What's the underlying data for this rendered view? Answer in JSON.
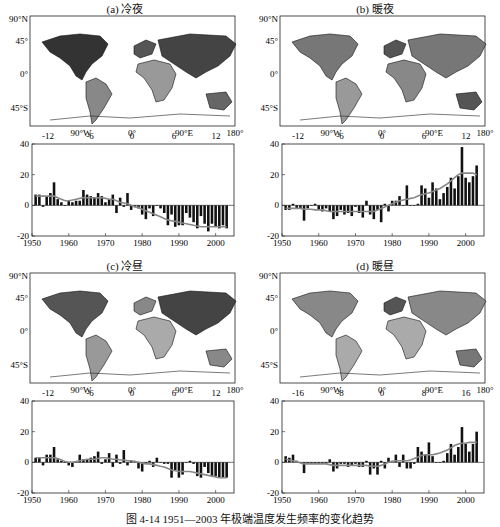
{
  "caption": "图 4-14   1951—2003 年极端温度发生频率的变化趋势",
  "map_axis": {
    "lat_labels": [
      "90°N",
      "45°",
      "0°",
      "45°S"
    ],
    "lon_labels": [
      "90°W",
      "0°",
      "90°E",
      "180°"
    ]
  },
  "panels": [
    {
      "id": "a",
      "title": "(a) 冷夜",
      "colorbar_ticks": [
        "-12",
        "-6",
        "0",
        "6",
        "12"
      ]
    },
    {
      "id": "b",
      "title": "(b) 暖夜",
      "colorbar_ticks": [
        "-12",
        "-6",
        "0",
        "6",
        "12"
      ]
    },
    {
      "id": "c",
      "title": "(c) 冷昼",
      "colorbar_ticks": [
        "-12",
        "-6",
        "0",
        "6",
        "12"
      ]
    },
    {
      "id": "d",
      "title": "(d) 暖昼",
      "colorbar_ticks": [
        "-16",
        "-8",
        "0",
        "8",
        "16"
      ]
    }
  ],
  "chart_data": [
    {
      "type": "bar",
      "title": "(a) 冷夜",
      "xlabel": "",
      "ylabel": "",
      "x": [
        1951,
        1952,
        1953,
        1954,
        1955,
        1956,
        1957,
        1958,
        1959,
        1960,
        1961,
        1962,
        1963,
        1964,
        1965,
        1966,
        1967,
        1968,
        1969,
        1970,
        1971,
        1972,
        1973,
        1974,
        1975,
        1976,
        1977,
        1978,
        1979,
        1980,
        1981,
        1982,
        1983,
        1984,
        1985,
        1986,
        1987,
        1988,
        1989,
        1990,
        1991,
        1992,
        1993,
        1994,
        1995,
        1996,
        1997,
        1998,
        1999,
        2000,
        2001,
        2002,
        2003
      ],
      "values": [
        7,
        7,
        -1,
        6,
        8,
        15,
        4,
        2,
        0,
        3,
        2,
        3,
        3,
        10,
        7,
        6,
        5,
        8,
        6,
        2,
        4,
        7,
        -5,
        5,
        -1,
        8,
        -3,
        -1,
        -2,
        -6,
        -9,
        -2,
        -7,
        0,
        -2,
        -5,
        -13,
        -6,
        -14,
        -13,
        -13,
        -5,
        -8,
        -11,
        -15,
        -7,
        -12,
        -17,
        -12,
        -14,
        -15,
        -13,
        -15
      ],
      "trend": [
        6,
        6,
        6,
        6,
        6,
        6,
        5,
        4,
        3,
        3,
        3.5,
        4,
        4.5,
        5,
        5,
        5,
        5,
        5,
        5,
        4.5,
        4,
        4,
        3,
        2,
        1.5,
        1,
        0,
        -1,
        -1.5,
        -2.5,
        -3.5,
        -4.5,
        -5.5,
        -6.5,
        -7.5,
        -8.5,
        -9.5,
        -10,
        -10.5,
        -11,
        -11.5,
        -12,
        -12.5,
        -13,
        -13.5,
        -14,
        -14,
        -14,
        -14,
        -14,
        -14,
        -14,
        -14
      ],
      "xlim": [
        1950,
        2005
      ],
      "ylim": [
        -20,
        40
      ],
      "xticks": [
        "1950",
        "1960",
        "1970",
        "1980",
        "1990",
        "2000"
      ],
      "yticks": [
        "-20",
        "0",
        "20",
        "40"
      ]
    },
    {
      "type": "bar",
      "title": "(b) 暖夜",
      "xlabel": "",
      "ylabel": "",
      "x": [
        1951,
        1952,
        1953,
        1954,
        1955,
        1956,
        1957,
        1958,
        1959,
        1960,
        1961,
        1962,
        1963,
        1964,
        1965,
        1966,
        1967,
        1968,
        1969,
        1970,
        1971,
        1972,
        1973,
        1974,
        1975,
        1976,
        1977,
        1978,
        1979,
        1980,
        1981,
        1982,
        1983,
        1984,
        1985,
        1986,
        1987,
        1988,
        1989,
        1990,
        1991,
        1992,
        1993,
        1994,
        1995,
        1996,
        1997,
        1998,
        1999,
        2000,
        2001,
        2002,
        2003
      ],
      "values": [
        -3,
        -3,
        1,
        -2,
        -2,
        -10,
        -2,
        0,
        1,
        -3,
        -4,
        -2,
        -4,
        -9,
        -7,
        -3,
        -6,
        -5,
        -7,
        -1,
        -5,
        -8,
        3,
        -6,
        -9,
        -3,
        -11,
        1,
        -4,
        3,
        3,
        6,
        0,
        13,
        0,
        0,
        1,
        13,
        11,
        5,
        15,
        11,
        4,
        8,
        12,
        18,
        11,
        19,
        38,
        18,
        15,
        19,
        26,
        21
      ],
      "trend": [
        -2,
        -2,
        -2,
        -2,
        -2,
        -2.5,
        -2.5,
        -2.5,
        -3,
        -3,
        -3,
        -3.5,
        -4,
        -4,
        -4,
        -4,
        -4,
        -4,
        -4,
        -4,
        -4,
        -4,
        -4,
        -4,
        -4,
        -3,
        -2,
        -1,
        0,
        1,
        2,
        3,
        3.5,
        4,
        4.5,
        5,
        6,
        7,
        7.5,
        8,
        9,
        10,
        11,
        12.5,
        14,
        16,
        18,
        20,
        21,
        21,
        21,
        21,
        20
      ],
      "xlim": [
        1950,
        2005
      ],
      "ylim": [
        -20,
        40
      ],
      "xticks": [
        "1950",
        "1960",
        "1970",
        "1980",
        "1990",
        "2000"
      ],
      "yticks": [
        "-20",
        "0",
        "20",
        "40"
      ]
    },
    {
      "type": "bar",
      "title": "(c) 冷昼",
      "xlabel": "",
      "ylabel": "",
      "x": [
        1951,
        1952,
        1953,
        1954,
        1955,
        1956,
        1957,
        1958,
        1959,
        1960,
        1961,
        1962,
        1963,
        1964,
        1965,
        1966,
        1967,
        1968,
        1969,
        1970,
        1971,
        1972,
        1973,
        1974,
        1975,
        1976,
        1977,
        1978,
        1979,
        1980,
        1981,
        1982,
        1983,
        1984,
        1985,
        1986,
        1987,
        1988,
        1989,
        1990,
        1991,
        1992,
        1993,
        1994,
        1995,
        1996,
        1997,
        1998,
        1999,
        2000,
        2001,
        2002,
        2003
      ],
      "values": [
        3,
        3,
        -2,
        5,
        5,
        10,
        2,
        1,
        0,
        -2,
        -3,
        0,
        5,
        2,
        2,
        3,
        4,
        7,
        -1,
        2,
        6,
        -3,
        5,
        -1,
        8,
        -2,
        1,
        1,
        -4,
        -6,
        -1,
        1,
        -3,
        3,
        0,
        -1,
        -1,
        -10,
        -5,
        -10,
        -8,
        0,
        1,
        -1,
        -9,
        -10,
        -3,
        -7,
        -9,
        -9,
        -10,
        -10,
        -10
      ],
      "trend": [
        3,
        3,
        3,
        3,
        3,
        3,
        2.5,
        1.5,
        0.5,
        0,
        0,
        0.5,
        1,
        1.5,
        2,
        2,
        2,
        2.5,
        3,
        3,
        2.5,
        2,
        2,
        1.5,
        1.5,
        1,
        1,
        0.5,
        0,
        -0.5,
        -1,
        -1,
        -1.5,
        -2,
        -2.5,
        -3,
        -4,
        -5,
        -5.5,
        -6,
        -6,
        -6,
        -6,
        -6.5,
        -7,
        -7.5,
        -8,
        -8.5,
        -9,
        -9.5,
        -10,
        -10,
        -10
      ],
      "xlim": [
        1950,
        2005
      ],
      "ylim": [
        -20,
        40
      ],
      "xticks": [
        "1950",
        "1960",
        "1970",
        "1980",
        "1990",
        "2000"
      ],
      "yticks": [
        "-20",
        "0",
        "20",
        "40"
      ]
    },
    {
      "type": "bar",
      "title": "(d) 暖昼",
      "xlabel": "",
      "ylabel": "",
      "x": [
        1951,
        1952,
        1953,
        1954,
        1955,
        1956,
        1957,
        1958,
        1959,
        1960,
        1961,
        1962,
        1963,
        1964,
        1965,
        1966,
        1967,
        1968,
        1969,
        1970,
        1971,
        1972,
        1973,
        1974,
        1975,
        1976,
        1977,
        1978,
        1979,
        1980,
        1981,
        1982,
        1983,
        1984,
        1985,
        1986,
        1987,
        1988,
        1989,
        1990,
        1991,
        1992,
        1993,
        1994,
        1995,
        1996,
        1997,
        1998,
        1999,
        2000,
        2001,
        2002,
        2003
      ],
      "values": [
        4,
        3,
        5,
        1,
        0,
        -7,
        -1,
        -1,
        -1,
        -1,
        -1,
        -1,
        2,
        -6,
        -4,
        -1,
        -1,
        -3,
        -2,
        -1,
        -3,
        -3,
        1,
        -8,
        -4,
        -8,
        1,
        -4,
        3,
        1,
        5,
        -3,
        5,
        -4,
        -4,
        -1,
        10,
        7,
        5,
        13,
        4,
        0,
        0,
        1,
        6,
        12,
        5,
        10,
        23,
        12,
        7,
        12,
        20,
        12
      ],
      "trend": [
        2,
        1.5,
        1,
        0.5,
        -0.5,
        -1,
        -1,
        -1,
        -1,
        -1,
        -1,
        -1,
        -1.5,
        -2,
        -2,
        -2,
        -2,
        -2,
        -2,
        -2,
        -2,
        -2,
        -2,
        -2.5,
        -2.5,
        -2.5,
        -2,
        -1,
        0,
        0.5,
        1,
        1,
        1,
        1,
        1.5,
        2.5,
        3.5,
        4.5,
        5,
        5,
        5,
        5.5,
        6,
        7,
        8,
        9.5,
        11,
        12,
        12.5,
        12.5,
        13,
        13,
        13
      ],
      "xlim": [
        1950,
        2005
      ],
      "ylim": [
        -20,
        40
      ],
      "xticks": [
        "1950",
        "1960",
        "1970",
        "1980",
        "1990",
        "2000"
      ],
      "yticks": [
        "-20",
        "0",
        "20",
        "40"
      ]
    }
  ]
}
